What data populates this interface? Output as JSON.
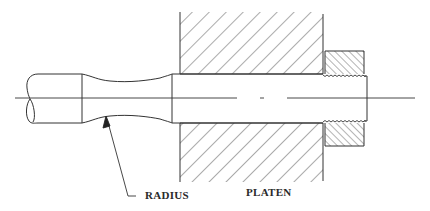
{
  "diagram": {
    "type": "mechanical-section-drawing",
    "labels": {
      "radius": "RADIUS",
      "platen": "PLATEN"
    },
    "components": [
      {
        "name": "specimen-shaft",
        "description": "round bar with broken-end symbol on left"
      },
      {
        "name": "reduced-radius-section",
        "description": "necked section with curved radius profile"
      },
      {
        "name": "platen",
        "description": "cross-hatched platen block with bore"
      },
      {
        "name": "threaded-nut",
        "description": "cross-hatched threaded retaining nut"
      },
      {
        "name": "centerline",
        "description": "dash-dot axis line through shaft"
      }
    ],
    "colors": {
      "stroke": "#333333",
      "background": "#ffffff"
    }
  }
}
